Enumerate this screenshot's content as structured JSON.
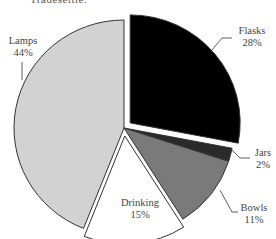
{
  "caption": "Tradesettle:",
  "chart_data": {
    "type": "pie",
    "title": "",
    "start_angle_deg": 0,
    "direction": "clockwise",
    "slices": [
      {
        "label": "Flasks",
        "value": 28,
        "display": "28%",
        "color": "#000000",
        "exploded": true
      },
      {
        "label": "Jars",
        "value": 2,
        "display": "2%",
        "color": "#2a2a2a",
        "exploded": false
      },
      {
        "label": "Bowls",
        "value": 11,
        "display": "11%",
        "color": "#7a7a7a",
        "exploded": false
      },
      {
        "label": "Drinking",
        "value": 15,
        "display": "15%",
        "color": "#ffffff",
        "exploded": true
      },
      {
        "label": "Lamps",
        "value": 44,
        "display": "44%",
        "color": "#d2d2d2",
        "exploded": false
      }
    ],
    "legend": "none (labels placed beside slices)"
  }
}
